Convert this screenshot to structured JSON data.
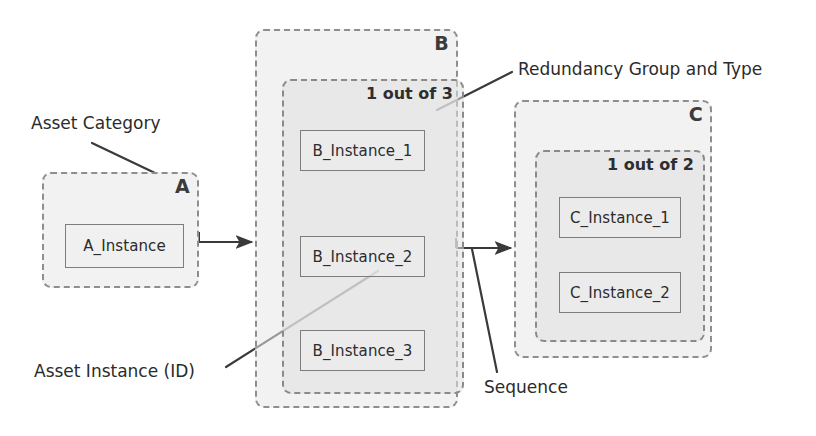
{
  "diagram": {
    "colors": {
      "group_border": "#8e8e8e",
      "group_fill": "#e8e8e8",
      "instance_border": "#7d7d7d",
      "instance_fill": "#eeeeee",
      "line": "#3a3a3a",
      "text": "#2b2b2b",
      "background": "#ffffff"
    },
    "groups": [
      {
        "id": "A",
        "label": "A",
        "redundancy": null,
        "instances": [
          "A_Instance"
        ]
      },
      {
        "id": "B",
        "label": "B",
        "redundancy": "1 out of 3",
        "instances": [
          "B_Instance_1",
          "B_Instance_2",
          "B_Instance_3"
        ]
      },
      {
        "id": "C",
        "label": "C",
        "redundancy": "1 out of 2",
        "instances": [
          "C_Instance_1",
          "C_Instance_2"
        ]
      }
    ],
    "annotations": {
      "asset_category": "Asset Category",
      "asset_instance": "Asset Instance (ID)",
      "redundancy_group_and_type": "Redundancy Group and Type",
      "sequence": "Sequence"
    },
    "flow": [
      {
        "from": "A",
        "to": "B"
      },
      {
        "from": "B",
        "to": "C"
      }
    ]
  }
}
